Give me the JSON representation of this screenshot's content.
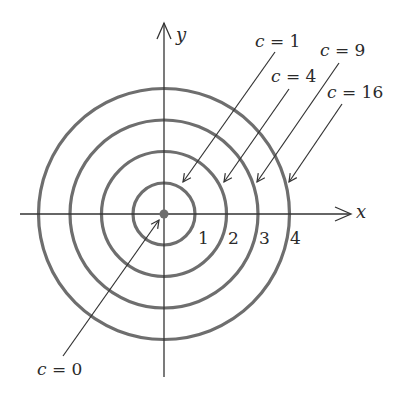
{
  "diagram": {
    "type": "level-curves",
    "axes": {
      "x_label": "x",
      "y_label": "y"
    },
    "tick_labels": [
      "1",
      "2",
      "3",
      "4"
    ],
    "level_labels": [
      {
        "var": "c",
        "eq": "=",
        "value": "0"
      },
      {
        "var": "c",
        "eq": "=",
        "value": "1"
      },
      {
        "var": "c",
        "eq": "=",
        "value": "4"
      },
      {
        "var": "c",
        "eq": "=",
        "value": "9"
      },
      {
        "var": "c",
        "eq": "=",
        "value": "16"
      }
    ],
    "circle_radii_units": [
      1,
      2,
      3,
      4
    ],
    "colors": {
      "circle": "#6e6e6e",
      "axis": "#333333",
      "text": "#2a2a2a",
      "center_dot": "#6e6e6e"
    }
  }
}
